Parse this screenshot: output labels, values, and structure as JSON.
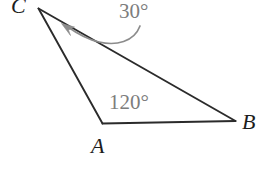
{
  "figure": {
    "kind": "geometry-diagram",
    "shape": "triangle",
    "width": 276,
    "height": 177,
    "background_color": "#ffffff",
    "stroke_color": "#2b2b2b",
    "annotation_color": "#7d7d7d",
    "label_color": "#1d1d1d"
  },
  "vertices": {
    "C": {
      "label": "C",
      "x": 38,
      "y": 8
    },
    "A": {
      "label": "A",
      "x": 102,
      "y": 123
    },
    "B": {
      "label": "B",
      "x": 235,
      "y": 121
    }
  },
  "edges": [
    {
      "name": "edge-CA",
      "from": "C",
      "to": "A"
    },
    {
      "name": "edge-AB",
      "from": "A",
      "to": "B"
    },
    {
      "name": "edge-CB",
      "from": "C",
      "to": "B"
    }
  ],
  "angles": {
    "at_C": {
      "label": "30°",
      "value": 30,
      "unit": "degrees",
      "vertex": "C"
    },
    "at_A": {
      "label": "120°",
      "value": 120,
      "unit": "degrees",
      "vertex": "A"
    }
  },
  "annotation_arrow": {
    "name": "curved-arrow-to-angle-C",
    "description": "gray curved leader arrow pointing from the 30 degree label toward vertex C",
    "color": "#8c8c8c",
    "points_to": "C"
  }
}
